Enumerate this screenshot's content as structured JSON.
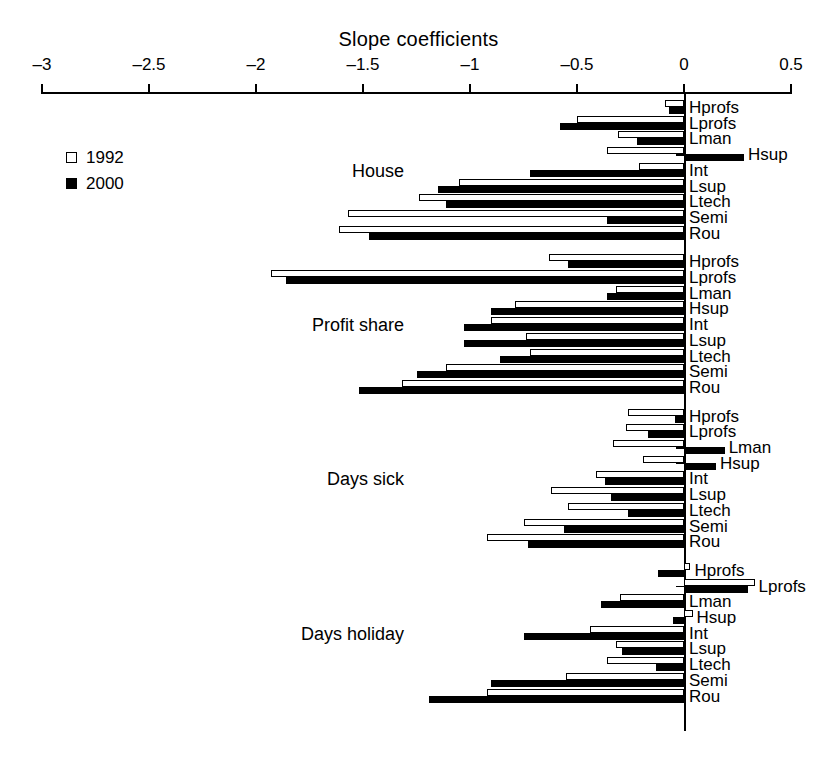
{
  "chart_data": {
    "type": "bar",
    "orientation": "horizontal",
    "title": "Slope coefficients",
    "xlabel": "",
    "ylabel": "",
    "xlim": [
      -3,
      0.5
    ],
    "xticks": [
      -3,
      -2.5,
      -2,
      -1.5,
      -1,
      -0.5,
      0,
      0.5
    ],
    "xticklabels": [
      "–3",
      "–2.5",
      "–2",
      "–1.5",
      "–1",
      "–0.5",
      "0",
      "0.5"
    ],
    "grid": false,
    "legend": {
      "position": "left",
      "entries": [
        "1992",
        "2000"
      ]
    },
    "series": [
      {
        "name": "1992",
        "style": "white-fill-black-outline"
      },
      {
        "name": "2000",
        "style": "black-fill"
      }
    ],
    "categories": [
      "Hprofs",
      "Lprofs",
      "Lman",
      "Hsup",
      "Int",
      "Lsup",
      "Ltech",
      "Semi",
      "Rou"
    ],
    "groups": [
      {
        "label": "House",
        "rows": [
          {
            "category": "Hprofs",
            "v1992": -0.09,
            "v2000": -0.07
          },
          {
            "category": "Lprofs",
            "v1992": -0.5,
            "v2000": -0.58
          },
          {
            "category": "Lman",
            "v1992": -0.31,
            "v2000": -0.22
          },
          {
            "category": "Hsup",
            "v1992": -0.36,
            "v2000": 0.28
          },
          {
            "category": "Int",
            "v1992": -0.21,
            "v2000": -0.72
          },
          {
            "category": "Lsup",
            "v1992": -1.05,
            "v2000": -1.15
          },
          {
            "category": "Ltech",
            "v1992": -1.24,
            "v2000": -1.11
          },
          {
            "category": "Semi",
            "v1992": -1.57,
            "v2000": -0.36
          },
          {
            "category": "Rou",
            "v1992": -1.61,
            "v2000": -1.47
          }
        ]
      },
      {
        "label": "Profit share",
        "rows": [
          {
            "category": "Hprofs",
            "v1992": -0.63,
            "v2000": -0.54
          },
          {
            "category": "Lprofs",
            "v1992": -1.93,
            "v2000": -1.86
          },
          {
            "category": "Lman",
            "v1992": -0.32,
            "v2000": -0.36
          },
          {
            "category": "Hsup",
            "v1992": -0.79,
            "v2000": -0.9
          },
          {
            "category": "Int",
            "v1992": -0.9,
            "v2000": -1.03
          },
          {
            "category": "Lsup",
            "v1992": -0.74,
            "v2000": -1.03
          },
          {
            "category": "Ltech",
            "v1992": -0.72,
            "v2000": -0.86
          },
          {
            "category": "Semi",
            "v1992": -1.11,
            "v2000": -1.25
          },
          {
            "category": "Rou",
            "v1992": -1.32,
            "v2000": -1.52
          }
        ]
      },
      {
        "label": "Days sick",
        "rows": [
          {
            "category": "Hprofs",
            "v1992": -0.26,
            "v2000": -0.04
          },
          {
            "category": "Lprofs",
            "v1992": -0.27,
            "v2000": -0.17
          },
          {
            "category": "Lman",
            "v1992": -0.33,
            "v2000": 0.19
          },
          {
            "category": "Hsup",
            "v1992": -0.19,
            "v2000": 0.15
          },
          {
            "category": "Int",
            "v1992": -0.41,
            "v2000": -0.37
          },
          {
            "category": "Lsup",
            "v1992": -0.62,
            "v2000": -0.34
          },
          {
            "category": "Ltech",
            "v1992": -0.54,
            "v2000": -0.26
          },
          {
            "category": "Semi",
            "v1992": -0.75,
            "v2000": -0.56
          },
          {
            "category": "Rou",
            "v1992": -0.92,
            "v2000": -0.73
          }
        ]
      },
      {
        "label": "Days holiday",
        "rows": [
          {
            "category": "Hprofs",
            "v1992": 0.03,
            "v2000": -0.12
          },
          {
            "category": "Lprofs",
            "v1992": 0.33,
            "v2000": 0.3
          },
          {
            "category": "Lman",
            "v1992": -0.3,
            "v2000": -0.39
          },
          {
            "category": "Hsup",
            "v1992": 0.04,
            "v2000": -0.05
          },
          {
            "category": "Int",
            "v1992": -0.44,
            "v2000": -0.75
          },
          {
            "category": "Lsup",
            "v1992": -0.32,
            "v2000": -0.29
          },
          {
            "category": "Ltech",
            "v1992": -0.36,
            "v2000": -0.13
          },
          {
            "category": "Semi",
            "v1992": -0.55,
            "v2000": -0.9
          },
          {
            "category": "Rou",
            "v1992": -0.92,
            "v2000": -1.19
          }
        ]
      }
    ]
  },
  "colors": {
    "axis": "#000000",
    "series_1992": "#ffffff",
    "series_2000": "#000000",
    "background": "#ffffff"
  }
}
